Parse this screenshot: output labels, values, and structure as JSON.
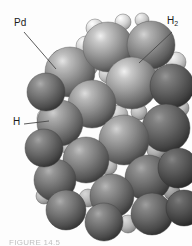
{
  "figure": {
    "background_color": "#fdfdfd",
    "caption": "FIGURE 14.5",
    "caption_color": "#8d8d8d"
  },
  "labels": {
    "palladium": {
      "text": "Pd",
      "leader": {
        "x1": 24,
        "y1": 32,
        "x2": 56,
        "y2": 69
      }
    },
    "hydrogen_molecule": {
      "text": "H",
      "subscript": "2",
      "leader": {
        "x1": 172,
        "y1": 32,
        "x2": 139,
        "y2": 63
      }
    },
    "hydrogen_atom": {
      "text": "H",
      "leader": {
        "x1": 24,
        "y1": 124,
        "x2": 49,
        "y2": 121
      }
    }
  },
  "legend": {
    "palladium_color": "#8a8a8a",
    "hydrogen_color": "#d5d5d5",
    "shadow_color": "#3a3a3a",
    "highlight_color": "#f2f2f2",
    "leader_line_color": "#4a4a4a"
  },
  "atoms": {
    "palladium": [
      {
        "cx": 70,
        "cy": 72,
        "r": 25,
        "shade": 0.95
      },
      {
        "cx": 108,
        "cy": 47,
        "r": 25,
        "shade": 1.0
      },
      {
        "cx": 151,
        "cy": 45,
        "r": 24,
        "shade": 0.88
      },
      {
        "cx": 132,
        "cy": 83,
        "r": 26,
        "shade": 1.0
      },
      {
        "cx": 92,
        "cy": 104,
        "r": 24,
        "shade": 0.92
      },
      {
        "cx": 60,
        "cy": 123,
        "r": 23,
        "shade": 0.86
      },
      {
        "cx": 172,
        "cy": 86,
        "r": 22,
        "shade": 0.62
      },
      {
        "cx": 166,
        "cy": 128,
        "r": 24,
        "shade": 0.64
      },
      {
        "cx": 124,
        "cy": 140,
        "r": 25,
        "shade": 0.88
      },
      {
        "cx": 86,
        "cy": 160,
        "r": 23,
        "shade": 0.8
      },
      {
        "cx": 55,
        "cy": 180,
        "r": 21,
        "shade": 0.74
      },
      {
        "cx": 148,
        "cy": 178,
        "r": 23,
        "shade": 0.7
      },
      {
        "cx": 178,
        "cy": 168,
        "r": 20,
        "shade": 0.55
      },
      {
        "cx": 112,
        "cy": 196,
        "r": 22,
        "shade": 0.76
      },
      {
        "cx": 66,
        "cy": 210,
        "r": 20,
        "shade": 0.72
      },
      {
        "cx": 152,
        "cy": 214,
        "r": 21,
        "shade": 0.66
      },
      {
        "cx": 104,
        "cy": 222,
        "r": 19,
        "shade": 0.7
      },
      {
        "cx": 46,
        "cy": 92,
        "r": 19,
        "shade": 0.72
      },
      {
        "cx": 44,
        "cy": 148,
        "r": 19,
        "shade": 0.68
      },
      {
        "cx": 184,
        "cy": 208,
        "r": 18,
        "shade": 0.52
      }
    ],
    "hydrogen": [
      {
        "cx": 95,
        "cy": 28,
        "r": 9,
        "shade": 1.0
      },
      {
        "cx": 123,
        "cy": 22,
        "r": 8,
        "shade": 1.0
      },
      {
        "cx": 142,
        "cy": 20,
        "r": 7,
        "shade": 0.96
      },
      {
        "cx": 86,
        "cy": 46,
        "r": 10,
        "shade": 0.98
      },
      {
        "cx": 88,
        "cy": 66,
        "r": 10,
        "shade": 0.94
      },
      {
        "cx": 108,
        "cy": 74,
        "r": 9,
        "shade": 0.92
      },
      {
        "cx": 48,
        "cy": 118,
        "r": 11,
        "shade": 1.0
      },
      {
        "cx": 47,
        "cy": 132,
        "r": 9,
        "shade": 0.92
      },
      {
        "cx": 176,
        "cy": 62,
        "r": 10,
        "shade": 0.96
      },
      {
        "cx": 180,
        "cy": 108,
        "r": 9,
        "shade": 0.88
      },
      {
        "cx": 118,
        "cy": 115,
        "r": 10,
        "shade": 0.9
      },
      {
        "cx": 139,
        "cy": 112,
        "r": 8,
        "shade": 0.86
      },
      {
        "cx": 70,
        "cy": 145,
        "r": 10,
        "shade": 0.9
      },
      {
        "cx": 108,
        "cy": 166,
        "r": 9,
        "shade": 0.88
      },
      {
        "cx": 156,
        "cy": 150,
        "r": 9,
        "shade": 0.82
      },
      {
        "cx": 132,
        "cy": 186,
        "r": 9,
        "shade": 0.84
      },
      {
        "cx": 88,
        "cy": 198,
        "r": 9,
        "shade": 0.84
      },
      {
        "cx": 44,
        "cy": 196,
        "r": 8,
        "shade": 0.86
      },
      {
        "cx": 172,
        "cy": 192,
        "r": 8,
        "shade": 0.72
      },
      {
        "cx": 128,
        "cy": 224,
        "r": 9,
        "shade": 0.86
      },
      {
        "cx": 60,
        "cy": 58,
        "r": 8,
        "shade": 0.88
      },
      {
        "cx": 150,
        "cy": 68,
        "r": 8,
        "shade": 0.8
      }
    ]
  }
}
